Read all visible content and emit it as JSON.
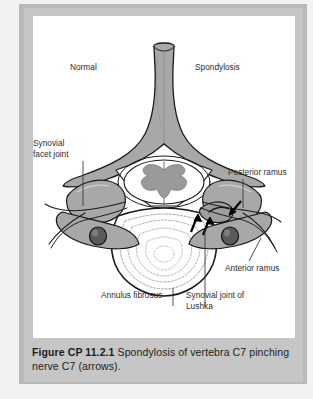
{
  "figure": {
    "caption_number": "Figure CP 11.2.1",
    "caption_body": "Spondylosis of vertebra C7 pinching nerve C7 (arrows)."
  },
  "labels": {
    "normal": "Normal",
    "spondylosis": "Spondylosis",
    "synovial_facet_joint": "Synovial\nfacet joint",
    "posterior_ramus": "Posterior ramus",
    "anterior_ramus": "Anterior ramus",
    "annulus_fibrosus": "Annulus fibrosus",
    "synovial_joint_lushka": "Synovial joint of\nLushka"
  },
  "colors": {
    "bone_fill": "#a8a8a8",
    "bone_outline": "#1a1a1a",
    "cord_gray_matter": "#9a9a9a",
    "cord_white_matter": "#ffffff",
    "artery_foramen": "#555555",
    "panel_background": "#ffffff",
    "frame_gray": "#c6c6c6",
    "caption_text": "#1c1c1c",
    "arrow_black": "#000000"
  },
  "illustration": {
    "view": "superior (axial) view of cervical vertebra C7",
    "sides": [
      {
        "name": "left-side-normal",
        "description": "normal synovial facet joint and patent nerve root canal"
      },
      {
        "name": "right-side-spondylosis",
        "description": "osteophytic overgrowth narrowing canal, pinching nerve"
      }
    ],
    "arrow_count": 3,
    "structures": [
      "spinous process (bifid)",
      "lamina",
      "vertebral foramen",
      "spinal cord with butterfly gray matter",
      "superior articular facet",
      "transverse foramen",
      "vertebral body",
      "annulus fibrosus lamellae",
      "anterior ramus",
      "posterior ramus",
      "joint of Lushka"
    ]
  }
}
